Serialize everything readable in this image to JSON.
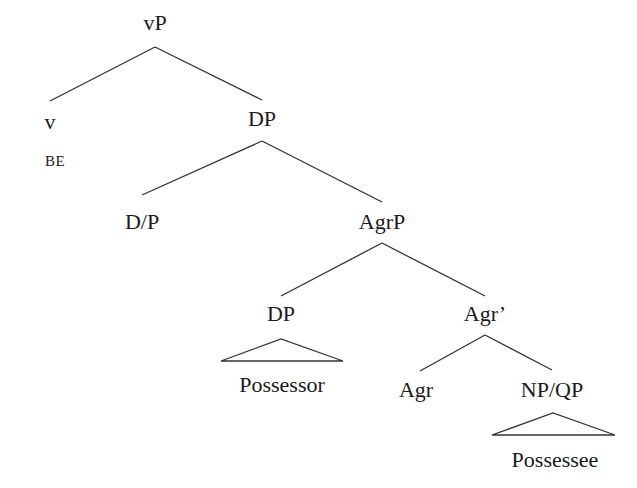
{
  "diagram": {
    "type": "syntax-tree",
    "nodes": {
      "vP": "vP",
      "v": "v",
      "v_gloss": "BE",
      "DP_top": "DP",
      "D_P": "D/P",
      "AgrP": "AgrP",
      "DP_spec": "DP",
      "possessor": "Possessor",
      "Agr_bar": "Agr’",
      "Agr": "Agr",
      "NP_QP": "NP/QP",
      "possessee": "Possessee"
    },
    "edges": [
      [
        "vP",
        "v"
      ],
      [
        "vP",
        "DP_top"
      ],
      [
        "DP_top",
        "D_P"
      ],
      [
        "DP_top",
        "AgrP"
      ],
      [
        "AgrP",
        "DP_spec"
      ],
      [
        "AgrP",
        "Agr_bar"
      ],
      [
        "DP_spec",
        "possessor",
        "triangle"
      ],
      [
        "Agr_bar",
        "Agr"
      ],
      [
        "Agr_bar",
        "NP_QP"
      ],
      [
        "NP_QP",
        "possessee",
        "triangle"
      ]
    ],
    "line_color": "#333333"
  }
}
